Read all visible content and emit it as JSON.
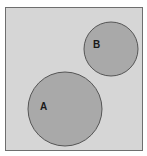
{
  "diagram": {
    "type": "venn",
    "sets": [
      {
        "label": "A",
        "cx": 65,
        "cy": 109,
        "r": 37
      },
      {
        "label": "B",
        "cx": 111,
        "cy": 49,
        "r": 27
      }
    ],
    "relation": "disjoint",
    "colors": {
      "universe": "#d6d6d6",
      "set_fill": "#a9a9a9",
      "stroke": "#555555"
    }
  }
}
